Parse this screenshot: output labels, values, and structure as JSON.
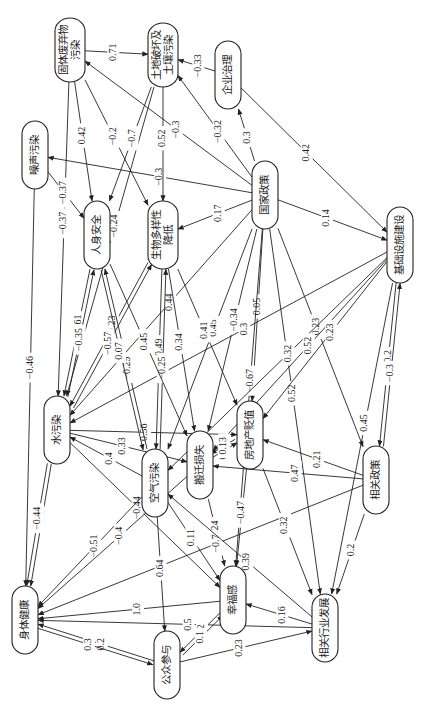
{
  "diagram": {
    "title": "",
    "orientation": "rotated-90-ccw",
    "nodes": [
      {
        "id": "solid_waste",
        "label": "固体废弃物污染",
        "lines": [
          "固体废弃物",
          "污染"
        ],
        "x": 70,
        "y": 50,
        "w": 30,
        "h": 64
      },
      {
        "id": "land",
        "label": "土地破坏及土壤污染",
        "lines": [
          "土地破坏及",
          "土壤污染"
        ],
        "x": 163,
        "y": 55,
        "w": 30,
        "h": 64
      },
      {
        "id": "enterprise",
        "label": "企业治理",
        "lines": [
          "企业治理"
        ],
        "x": 228,
        "y": 75,
        "w": 26,
        "h": 68
      },
      {
        "id": "noise",
        "label": "噪声污染",
        "lines": [
          "噪声污染"
        ],
        "x": 35,
        "y": 155,
        "w": 26,
        "h": 68
      },
      {
        "id": "national_policy",
        "label": "国家政策",
        "lines": [
          "国家政策"
        ],
        "x": 265,
        "y": 195,
        "w": 26,
        "h": 68
      },
      {
        "id": "safety",
        "label": "人身安全",
        "lines": [
          "人身安全"
        ],
        "x": 97,
        "y": 235,
        "w": 26,
        "h": 68
      },
      {
        "id": "biodiversity",
        "label": "生物多样性降低",
        "lines": [
          "生物多样性",
          "降低"
        ],
        "x": 163,
        "y": 235,
        "w": 30,
        "h": 68
      },
      {
        "id": "infrastructure",
        "label": "基础设施建设",
        "lines": [
          "基础设施建设"
        ],
        "x": 400,
        "y": 245,
        "w": 26,
        "h": 76
      },
      {
        "id": "water",
        "label": "水污染",
        "lines": [
          "水污染"
        ],
        "x": 57,
        "y": 430,
        "w": 26,
        "h": 68
      },
      {
        "id": "air",
        "label": "空气污染",
        "lines": [
          "空气污染"
        ],
        "x": 155,
        "y": 483,
        "w": 26,
        "h": 68
      },
      {
        "id": "relocation",
        "label": "搬迁损失",
        "lines": [
          "搬迁损失"
        ],
        "x": 200,
        "y": 465,
        "w": 26,
        "h": 68
      },
      {
        "id": "real_estate",
        "label": "房地产贬值",
        "lines": [
          "房地产贬值"
        ],
        "x": 250,
        "y": 435,
        "w": 26,
        "h": 68
      },
      {
        "id": "related_policy",
        "label": "相关政策",
        "lines": [
          "相关政策"
        ],
        "x": 376,
        "y": 480,
        "w": 26,
        "h": 68
      },
      {
        "id": "health",
        "label": "身体健康",
        "lines": [
          "身体健康"
        ],
        "x": 25,
        "y": 620,
        "w": 26,
        "h": 68
      },
      {
        "id": "happiness",
        "label": "幸福感",
        "lines": [
          "幸福感"
        ],
        "x": 233,
        "y": 600,
        "w": 26,
        "h": 68
      },
      {
        "id": "participation",
        "label": "公众参与",
        "lines": [
          "公众参与"
        ],
        "x": 167,
        "y": 665,
        "w": 26,
        "h": 68
      },
      {
        "id": "industry",
        "label": "相关行业发展",
        "lines": [
          "相关行业发展"
        ],
        "x": 325,
        "y": 628,
        "w": 26,
        "h": 68
      }
    ],
    "edges": [
      {
        "from": "solid_waste",
        "to": "land",
        "weight": "0.71"
      },
      {
        "from": "enterprise",
        "to": "land",
        "weight": "−0.33"
      },
      {
        "from": "enterprise",
        "to": "infrastructure",
        "weight": "0.42"
      },
      {
        "from": "national_policy",
        "to": "enterprise",
        "weight": "0.3"
      },
      {
        "from": "national_policy",
        "to": "solid_waste",
        "weight": "−0.3"
      },
      {
        "from": "national_policy",
        "to": "land",
        "weight": "−0.32"
      },
      {
        "from": "national_policy",
        "to": "noise",
        "weight": "−0.3"
      },
      {
        "from": "national_policy",
        "to": "biodiversity",
        "weight": "0.17"
      },
      {
        "from": "national_policy",
        "to": "infrastructure",
        "weight": "0.14"
      },
      {
        "from": "national_policy",
        "to": "water",
        "weight": "0.44"
      },
      {
        "from": "national_policy",
        "to": "air",
        "weight": "0.45"
      },
      {
        "from": "national_policy",
        "to": "relocation",
        "weight": "−0.34"
      },
      {
        "from": "national_policy",
        "to": "real_estate",
        "weight": "0.05"
      },
      {
        "from": "national_policy",
        "to": "industry",
        "weight": "0.52"
      },
      {
        "from": "national_policy",
        "to": "related_policy",
        "weight": "0.23"
      },
      {
        "from": "national_policy",
        "to": "happiness",
        "weight": "−0.67"
      },
      {
        "from": "solid_waste",
        "to": "safety",
        "weight": "0.42"
      },
      {
        "from": "solid_waste",
        "to": "water",
        "weight": "−0.37"
      },
      {
        "from": "solid_waste",
        "to": "biodiversity",
        "weight": "−0.2"
      },
      {
        "from": "land",
        "to": "biodiversity",
        "weight": "0.52"
      },
      {
        "from": "land",
        "to": "water",
        "weight": "−0.24"
      },
      {
        "from": "land",
        "to": "safety",
        "weight": "−0.7"
      },
      {
        "from": "noise",
        "to": "safety",
        "weight": "−0.37"
      },
      {
        "from": "noise",
        "to": "health",
        "weight": "−0.46"
      },
      {
        "from": "safety",
        "to": "water",
        "weight": "−0.61"
      },
      {
        "from": "biodiversity",
        "to": "water",
        "weight": "−0.23"
      },
      {
        "from": "biodiversity",
        "to": "air",
        "weight": "−0.49"
      },
      {
        "from": "infrastructure",
        "to": "water",
        "weight": "0.3"
      },
      {
        "from": "infrastructure",
        "to": "air",
        "weight": "0.32"
      },
      {
        "from": "infrastructure",
        "to": "relocation",
        "weight": "0.52"
      },
      {
        "from": "infrastructure",
        "to": "real_estate",
        "weight": "0.23"
      },
      {
        "from": "infrastructure",
        "to": "related_policy",
        "weight": "0.2"
      },
      {
        "from": "related_policy",
        "to": "infrastructure",
        "weight": "−0.3"
      },
      {
        "from": "infrastructure",
        "to": "industry",
        "weight": "0.45"
      },
      {
        "from": "water",
        "to": "safety",
        "weight": "−0.35"
      },
      {
        "from": "water",
        "to": "biodiversity",
        "weight": "−0.57"
      },
      {
        "from": "water",
        "to": "real_estate",
        "weight": "0.56"
      },
      {
        "from": "water",
        "to": "health",
        "weight": "−0.8"
      },
      {
        "from": "water",
        "to": "happiness",
        "weight": "−0.44"
      },
      {
        "from": "water",
        "to": "relocation",
        "weight": "0.33"
      },
      {
        "from": "air",
        "to": "safety",
        "weight": "−0.29"
      },
      {
        "from": "air",
        "to": "health",
        "weight": "−0.51"
      },
      {
        "from": "air",
        "to": "water",
        "weight": "0.4"
      },
      {
        "from": "air",
        "to": "biodiversity",
        "weight": "−0.25"
      },
      {
        "from": "air",
        "to": "happiness",
        "weight": "0.11"
      },
      {
        "from": "relocation",
        "to": "real_estate",
        "weight": "0.21"
      },
      {
        "from": "relocation",
        "to": "happiness",
        "weight": "0.24"
      },
      {
        "from": "real_estate",
        "to": "relocation",
        "weight": "0.13"
      },
      {
        "from": "real_estate",
        "to": "happiness",
        "weight": "−0.47"
      },
      {
        "from": "related_policy",
        "to": "relocation",
        "weight": "0.47"
      },
      {
        "from": "related_policy",
        "to": "industry",
        "weight": "0.2"
      },
      {
        "from": "related_policy",
        "to": "real_estate",
        "weight": "0.21"
      },
      {
        "from": "related_policy",
        "to": "health",
        "weight": "−0.7"
      },
      {
        "from": "industry",
        "to": "happiness",
        "weight": "0.16"
      },
      {
        "from": "industry",
        "to": "air",
        "weight": "0.39"
      },
      {
        "from": "industry",
        "to": "health",
        "weight": "0.5"
      },
      {
        "from": "happiness",
        "to": "health",
        "weight": "1.0"
      },
      {
        "from": "happiness",
        "to": "participation",
        "weight": "0.2"
      },
      {
        "from": "participation",
        "to": "happiness",
        "weight": "0.1"
      },
      {
        "from": "participation",
        "to": "health",
        "weight": "0.2"
      },
      {
        "from": "participation",
        "to": "industry",
        "weight": "0.23"
      },
      {
        "from": "health",
        "to": "participation",
        "weight": "0.3"
      },
      {
        "from": "air",
        "to": "participation",
        "weight": "0.64"
      },
      {
        "from": "water",
        "to": "health",
        "weight": "−0.44"
      },
      {
        "from": "safety",
        "to": "air",
        "weight": "0.07"
      },
      {
        "from": "biodiversity",
        "to": "real_estate",
        "weight": "0.41"
      },
      {
        "from": "biodiversity",
        "to": "relocation",
        "weight": "0.34"
      },
      {
        "from": "safety",
        "to": "relocation",
        "weight": "0.45"
      },
      {
        "from": "relocation",
        "to": "health",
        "weight": "−0.4"
      },
      {
        "from": "real_estate",
        "to": "industry",
        "weight": "0.32"
      }
    ]
  }
}
